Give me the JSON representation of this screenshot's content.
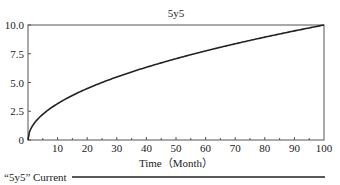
{
  "chart_data": {
    "type": "line",
    "title": "5y5",
    "xlabel": "Time（Month）",
    "ylabel": "",
    "xlim": [
      0,
      100
    ],
    "ylim": [
      0,
      10
    ],
    "x_ticks": [
      10,
      20,
      30,
      40,
      50,
      60,
      70,
      80,
      90,
      100
    ],
    "x_tick_labels": [
      "10",
      "20",
      "30",
      "40",
      "50",
      "60",
      "70",
      "80",
      "90",
      "100"
    ],
    "y_ticks": [
      0,
      2.5,
      5.0,
      7.5,
      10.0
    ],
    "y_tick_labels": [
      "0",
      "2.5",
      "5.0",
      "7.5",
      "10.0"
    ],
    "grid": false,
    "legend_position": "bottom",
    "series": [
      {
        "name": "“5y5” Current",
        "color": "#222222",
        "x": [
          0,
          0.5,
          1,
          2,
          3,
          5,
          7,
          10,
          15,
          20,
          25,
          30,
          35,
          40,
          45,
          50,
          55,
          60,
          65,
          70,
          75,
          80,
          85,
          90,
          95,
          100
        ],
        "values": [
          0,
          0.71,
          1.0,
          1.41,
          1.73,
          2.24,
          2.65,
          3.16,
          3.87,
          4.47,
          5.0,
          5.48,
          5.92,
          6.32,
          6.71,
          7.07,
          7.42,
          7.75,
          8.06,
          8.37,
          8.66,
          8.94,
          9.22,
          9.49,
          9.75,
          10.0
        ]
      }
    ]
  },
  "legend": {
    "label": "“5y5” Current"
  }
}
